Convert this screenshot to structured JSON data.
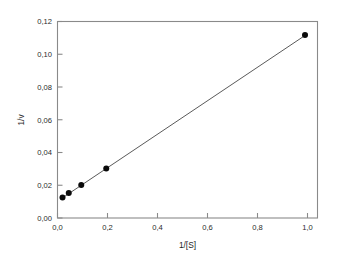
{
  "chart_data": {
    "type": "scatter",
    "title": "",
    "subtitle": "",
    "xlabel": "1/[S]",
    "ylabel": "1/v",
    "xlim": [
      0.0,
      1.04
    ],
    "ylim": [
      0.0,
      0.12
    ],
    "grid": false,
    "legend": false,
    "legend_position": "none",
    "x_tick_labels": [
      "0,0",
      "0,2",
      "0,4",
      "0,6",
      "0,8",
      "1,0"
    ],
    "x_tick_values": [
      0.0,
      0.2,
      0.4,
      0.6,
      0.8,
      1.0
    ],
    "y_tick_labels": [
      "0,00",
      "0,02",
      "0,04",
      "0,06",
      "0,08",
      "0,10",
      "0,12"
    ],
    "y_tick_values": [
      0.0,
      0.02,
      0.04,
      0.06,
      0.08,
      0.1,
      0.12
    ],
    "series": [
      {
        "name": "data points",
        "marker": "filled-circle",
        "color": "#0a0a0a",
        "x": [
          0.02,
          0.045,
          0.095,
          0.195,
          0.99
        ],
        "y": [
          0.0125,
          0.0152,
          0.0202,
          0.0303,
          0.1118
        ]
      },
      {
        "name": "linear fit",
        "marker": "none",
        "color": "#5a5a5a",
        "x": [
          0.015,
          1.0
        ],
        "y": [
          0.0118,
          0.1125
        ]
      }
    ],
    "colors": {
      "point": "#0a0a0a",
      "line": "#5a5a5a",
      "axis": "#8a8a8a",
      "text": "#2b2b2b",
      "background": "#ffffff"
    }
  }
}
